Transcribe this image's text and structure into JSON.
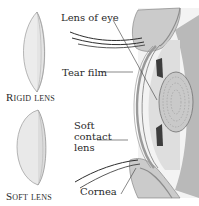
{
  "diagram": {
    "lenses": {
      "rigid": {
        "caption": "Rigid lens"
      },
      "soft": {
        "caption": "Soft lens"
      }
    },
    "eye_labels": {
      "lens_of_eye": "Lens of eye",
      "tear_film": "Tear film",
      "soft_contact_lens": "Soft contact lens",
      "cornea": "Cornea"
    },
    "colors": {
      "eyelid": "#c9c9c9",
      "eyeball_light": "#e6e6e6",
      "eyeball_mid": "#d2d2d2",
      "iris_dark": "#8f8f8f",
      "lens_body": "#cfcfcf",
      "contact_lens": "#9a9a9a",
      "line": "#3a3a3a"
    }
  }
}
